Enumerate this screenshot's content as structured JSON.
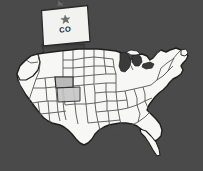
{
  "graphic": {
    "type": "map-with-callout",
    "subject": "United States map with highlighted state",
    "background_color": "#4a4a4a"
  },
  "callout": {
    "name": "state-callout-box",
    "state_abbreviation": "CO",
    "state_name": "Colorado",
    "icon": "star-icon",
    "box_fill": "#f2f2f0",
    "box_stroke": "#2a2a2a",
    "star_color": "#6e6e6e",
    "text_color": "#1c1c1c"
  },
  "beam": {
    "name": "callout-connector-beam",
    "fill_top": "#3d3d3d",
    "fill_bottom": "#d8d8d8",
    "opacity": 0.72
  },
  "map": {
    "name": "usa-map",
    "land_fill": "#f7f7f5",
    "border_stroke": "#4d4d4d",
    "outline_stroke": "#1f1f1f",
    "lake_fill": "#3a3a3a",
    "highlight_state": "CO",
    "highlight_fill": "#b9b9b9"
  },
  "top_marker": {
    "name": "top-edge-marker",
    "color": "#8a8a8a"
  }
}
